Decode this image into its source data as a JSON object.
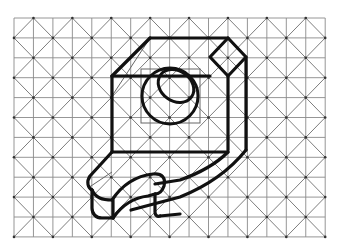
{
  "figure": {
    "title": "Isometric sketch of bracket on square/diagonal grid paper",
    "grid": {
      "x0": 14,
      "y0": 18,
      "cols": 16,
      "rows": 11,
      "cell_w": 19.45,
      "cell_h": 19.9,
      "line_color": "#8a8a8a",
      "diag_color": "#6e6e6e",
      "dot_color": "#333333"
    },
    "object": {
      "stroke_color": "#111111",
      "stroke_width": 3.2,
      "thin_color": "#555555"
    }
  }
}
